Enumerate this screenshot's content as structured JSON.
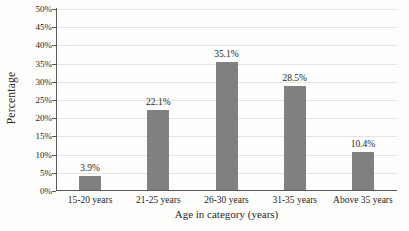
{
  "chart_data": {
    "type": "bar",
    "title": "",
    "categories": [
      "15-20 years",
      "21-25 years",
      "26-30 years",
      "31-35 years",
      "Above 35 years"
    ],
    "values": [
      3.9,
      22.1,
      35.1,
      28.5,
      10.4
    ],
    "data_labels": [
      "3.9%",
      "22.1%",
      "35.1%",
      "28.5%",
      "10.4%"
    ],
    "xlabel": "Age in category (years)",
    "ylabel": "Percentage",
    "ylim": [
      0,
      50
    ],
    "ytick_values": [
      0,
      5,
      10,
      15,
      20,
      25,
      30,
      35,
      40,
      45,
      50
    ],
    "ytick_labels": [
      "0%",
      "5%",
      "10%",
      "15%",
      "20%",
      "25%",
      "30%",
      "35%",
      "40%",
      "45%",
      "50%"
    ],
    "grid": "horizontal",
    "legend": "none",
    "bar_color": "#808080",
    "gridline_color": "#e3e3e3",
    "axis_color": "#5a5a5a"
  }
}
